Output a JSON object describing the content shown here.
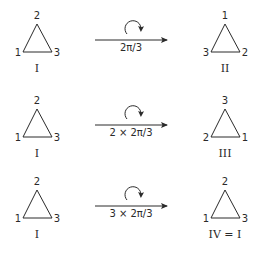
{
  "colors": {
    "ink": "#2a2a2a",
    "background": "#ffffff"
  },
  "rows": [
    {
      "left": {
        "top": "2",
        "left": "1",
        "right": "3",
        "name": "I"
      },
      "operation": "2π/3",
      "right": {
        "top": "1",
        "left": "3",
        "right": "2",
        "name": "II"
      }
    },
    {
      "left": {
        "top": "2",
        "left": "1",
        "right": "3",
        "name": "I"
      },
      "operation": "2 × 2π/3",
      "right": {
        "top": "3",
        "left": "2",
        "right": "1",
        "name": "III"
      }
    },
    {
      "left": {
        "top": "2",
        "left": "1",
        "right": "3",
        "name": "I"
      },
      "operation": "3 × 2π/3",
      "right": {
        "top": "2",
        "left": "1",
        "right": "3",
        "name": "IV = I"
      }
    }
  ],
  "icons": {
    "rotation": "clockwise-rotation-arrow-icon",
    "transform": "right-arrow-icon"
  }
}
